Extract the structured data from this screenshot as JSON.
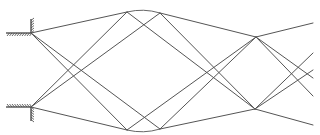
{
  "diagram": {
    "type": "ray-diagram",
    "stroke_color": "#555555",
    "anchors": [
      {
        "id": "A",
        "label": "",
        "x": 31,
        "y": 33,
        "wall": "top"
      },
      {
        "id": "B",
        "label": "",
        "x": 31,
        "y": 107,
        "wall": "bottom"
      }
    ],
    "nodes": [
      {
        "id": "T1",
        "x": 127,
        "y": 12
      },
      {
        "id": "T2",
        "x": 160,
        "y": 13
      },
      {
        "id": "B1",
        "x": 127,
        "y": 130
      },
      {
        "id": "B2",
        "x": 160,
        "y": 129
      },
      {
        "id": "R1",
        "x": 256,
        "y": 37
      },
      {
        "id": "R2",
        "x": 255,
        "y": 109
      }
    ],
    "segments": [
      {
        "from": "A",
        "to": "T1"
      },
      {
        "from": "A",
        "to": "B1"
      },
      {
        "from": "A",
        "to": "B2"
      },
      {
        "from": "B",
        "to": "B1"
      },
      {
        "from": "B",
        "to": "T1"
      },
      {
        "from": "B",
        "to": "T2"
      },
      {
        "from": "T2",
        "to": "R1"
      },
      {
        "from": "T1",
        "to": "R2"
      },
      {
        "from": "T2",
        "to": "R2"
      },
      {
        "from": "B1",
        "to": "R1"
      },
      {
        "from": "B2",
        "to": "R1"
      },
      {
        "from": "B2",
        "to": "R2"
      }
    ],
    "arcs": [
      {
        "from": "T1",
        "to": "T2",
        "bulge": "up"
      },
      {
        "from": "B1",
        "to": "B2",
        "bulge": "down"
      }
    ],
    "exits": [
      {
        "from": "R1",
        "x": 313,
        "y": 23
      },
      {
        "from": "R1",
        "x": 313,
        "y": 78
      },
      {
        "from": "R1",
        "x": 313,
        "y": 96
      },
      {
        "from": "R2",
        "x": 313,
        "y": 53
      },
      {
        "from": "R2",
        "x": 313,
        "y": 70
      },
      {
        "from": "R2",
        "x": 313,
        "y": 125
      }
    ]
  }
}
